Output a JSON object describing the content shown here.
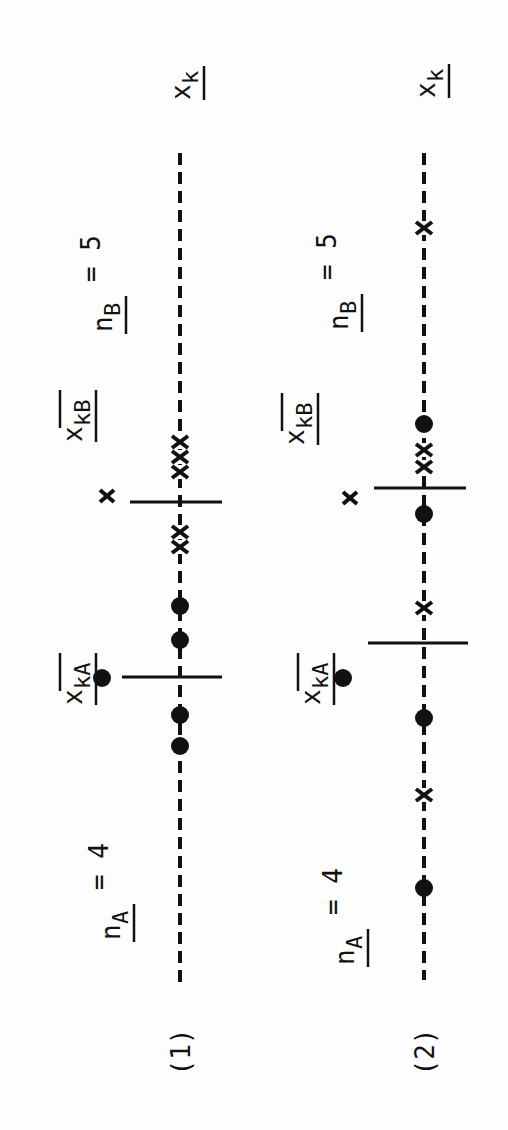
{
  "figure": {
    "orientation": "rotated -90deg",
    "ink_color": "#111111",
    "background": "#fdfdfd",
    "panels": [
      {
        "id": "1",
        "label": "(1)",
        "n_A_label": "n",
        "n_A_sub": "A",
        "n_A_value": "= 4",
        "n_B_label": "n",
        "n_B_sub": "B",
        "n_B_value": "= 5",
        "mean_A_label": "x",
        "mean_A_sub": "kA",
        "mean_B_label": "x",
        "mean_B_sub": "kB",
        "axis_label": "x",
        "axis_sub": "k",
        "axis_x": 180,
        "axis_y_start": 153,
        "axis_y_end": 987,
        "mean_A_tick_y": 677,
        "mean_B_tick_y": 502,
        "group_A_points_y": [
          606,
          640,
          715,
          746
        ],
        "group_B_points_y": [
          442,
          457,
          472,
          532,
          547
        ]
      },
      {
        "id": "2",
        "label": "(2)",
        "n_A_label": "n",
        "n_A_sub": "A",
        "n_A_value": "= 4",
        "n_B_label": "n",
        "n_B_sub": "B",
        "n_B_value": "= 5",
        "mean_A_label": "x",
        "mean_A_sub": "kA",
        "mean_B_label": "x",
        "mean_B_sub": "kB",
        "axis_label": "x",
        "axis_sub": "k",
        "axis_x": 424,
        "axis_y_start": 153,
        "axis_y_end": 980,
        "mean_A_tick_y": 643,
        "mean_B_tick_y": 488,
        "group_A_points_y": [
          424,
          514,
          718,
          888
        ],
        "group_B_points_y": [
          228,
          450,
          467,
          608,
          795
        ]
      }
    ],
    "legend": {
      "dot": "group A observation",
      "cross": "group B observation"
    }
  }
}
